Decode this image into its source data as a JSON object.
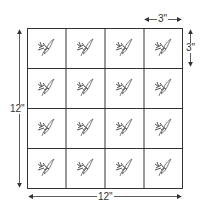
{
  "diagram": {
    "type": "quilt-block-grid",
    "rows": 4,
    "cols": 4,
    "motif": "leaf-sprig",
    "dimensions": {
      "total_height_label": "12\"",
      "total_width_label": "12\"",
      "cell_width_label": "3\"",
      "cell_height_label": "3\""
    },
    "colors": {
      "line": "#333333",
      "motif": "#555555",
      "background": "#ffffff"
    }
  }
}
